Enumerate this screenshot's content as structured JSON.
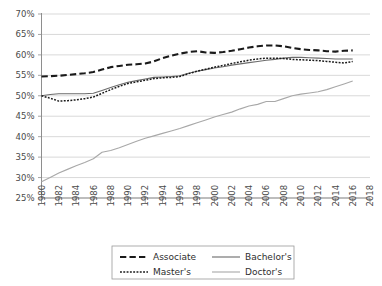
{
  "chart_data": {
    "type": "line",
    "title": "",
    "subtitle": "",
    "xlabel": "",
    "ylabel": "",
    "xlim": [
      1980,
      2018
    ],
    "ylim": [
      25,
      70
    ],
    "grid": true,
    "legend_position": "bottom-center",
    "x_tick_labels": [
      "1980",
      "1982",
      "1984",
      "1986",
      "1988",
      "1990",
      "1992",
      "1994",
      "1996",
      "1998",
      "2000",
      "2002",
      "2004",
      "2006",
      "2008",
      "2010",
      "2012",
      "2014",
      "2016",
      "2018"
    ],
    "x_tick_values": [
      1980,
      1982,
      1984,
      1986,
      1988,
      1990,
      1992,
      1994,
      1996,
      1998,
      2000,
      2002,
      2004,
      2006,
      2008,
      2010,
      2012,
      2014,
      2016,
      2018
    ],
    "y_tick_labels": [
      "70%",
      "65%",
      "60%",
      "55%",
      "50%",
      "45%",
      "40%",
      "35%",
      "30%",
      "25%"
    ],
    "y_tick_values": [
      70,
      65,
      60,
      55,
      50,
      45,
      40,
      35,
      30,
      25
    ],
    "x": [
      1980,
      1981,
      1982,
      1983,
      1984,
      1985,
      1986,
      1987,
      1988,
      1989,
      1990,
      1991,
      1992,
      1993,
      1994,
      1995,
      1996,
      1997,
      1998,
      1999,
      2000,
      2001,
      2002,
      2003,
      2004,
      2005,
      2006,
      2007,
      2008,
      2009,
      2010,
      2011,
      2012,
      2013,
      2014,
      2015,
      2016
    ],
    "series": [
      {
        "name": "Associate",
        "style": "dashed",
        "color": "#1a1a1a",
        "width": 2.1,
        "values": [
          54.7,
          54.8,
          54.9,
          55.1,
          55.3,
          55.5,
          55.8,
          56.4,
          57.0,
          57.3,
          57.6,
          57.7,
          57.9,
          58.4,
          59.2,
          59.8,
          60.3,
          60.7,
          60.9,
          60.6,
          60.5,
          60.7,
          61.0,
          61.4,
          61.8,
          62.1,
          62.3,
          62.3,
          62.1,
          61.7,
          61.4,
          61.2,
          61.1,
          60.9,
          60.8,
          61.0,
          61.1
        ]
      },
      {
        "name": "Bachelor's",
        "style": "solid",
        "color": "#6b6b6b",
        "width": 1.1,
        "values": [
          50.0,
          50.3,
          50.5,
          50.5,
          50.5,
          50.5,
          50.6,
          51.3,
          52.0,
          52.7,
          53.3,
          53.7,
          54.1,
          54.5,
          54.6,
          54.7,
          54.9,
          55.5,
          56.0,
          56.4,
          56.8,
          57.1,
          57.5,
          57.8,
          58.1,
          58.4,
          58.7,
          58.9,
          59.2,
          59.4,
          59.4,
          59.3,
          59.2,
          59.1,
          59.0,
          59.0,
          59.0
        ]
      },
      {
        "name": "Master's",
        "style": "dotted",
        "color": "#1a1a1a",
        "width": 1.5,
        "values": [
          50.0,
          49.4,
          48.7,
          48.8,
          49.0,
          49.3,
          49.7,
          50.6,
          51.5,
          52.3,
          53.0,
          53.4,
          53.8,
          54.2,
          54.4,
          54.5,
          54.7,
          55.4,
          56.0,
          56.5,
          57.0,
          57.4,
          57.9,
          58.3,
          58.7,
          59.0,
          59.2,
          59.2,
          59.1,
          58.9,
          58.8,
          58.7,
          58.6,
          58.4,
          58.2,
          58.0,
          58.4
        ]
      },
      {
        "name": "Doctor's",
        "style": "solid",
        "color": "#a8a8a8",
        "width": 1.1,
        "values": [
          29.0,
          30.0,
          31.1,
          32.0,
          32.9,
          33.7,
          34.6,
          36.2,
          36.6,
          37.3,
          38.1,
          38.9,
          39.6,
          40.2,
          40.8,
          41.4,
          42.0,
          42.7,
          43.4,
          44.1,
          44.8,
          45.4,
          46.0,
          46.8,
          47.5,
          47.9,
          48.6,
          48.6,
          49.3,
          50.0,
          50.4,
          50.7,
          51.0,
          51.5,
          52.2,
          52.9,
          53.6
        ]
      }
    ],
    "legend_entries": [
      {
        "label": "Associate",
        "style": "dashed",
        "color": "#1a1a1a"
      },
      {
        "label": "Bachelor's",
        "style": "solid",
        "color": "#6b6b6b"
      },
      {
        "label": "Master's",
        "style": "dotted",
        "color": "#1a1a1a"
      },
      {
        "label": "Doctor's",
        "style": "solid",
        "color": "#a8a8a8"
      }
    ]
  },
  "colors": {
    "background": "#ffffff",
    "gridline": "#c9c9c9",
    "axis": "#8e8e8e",
    "text": "#4a4a4a",
    "legend_border": "#9a9a9a"
  }
}
